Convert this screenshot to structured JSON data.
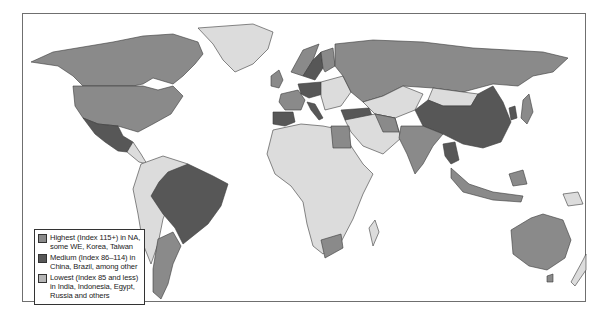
{
  "map": {
    "type": "choropleth",
    "projection": "world",
    "shade_colors": {
      "dark": "#575757",
      "mid": "#8a8a8a",
      "light": "#dcdcdc",
      "ocean": "#ffffff",
      "border": "#3a3a3a"
    },
    "legend": {
      "items": [
        {
          "label": "Highest (Index 115+) in NA, some WE, Korea, Taiwan",
          "swatch": "#8a8a8a"
        },
        {
          "label": "Medium (Index 86–114) in China, Brazil, among other",
          "swatch": "#575757"
        },
        {
          "label": "Lowest (Index 85 and less) in India, Indonesia, Egypt, Russia and others",
          "swatch": "#b5b5b5"
        }
      ]
    },
    "note": "Legend key-to-shade pairing as printed does not match shading of several regions (e.g. Russia and India listed under Lowest but drawn mid-gray). Shades below record what is visibly drawn.",
    "regions_by_visible_shade": {
      "dark": [
        "Mexico",
        "China",
        "Brazil",
        "Germany",
        "Spain",
        "Italy",
        "Sweden",
        "Turkey",
        "Thailand",
        "Cambodia",
        "Korea"
      ],
      "mid": [
        "Canada",
        "United States",
        "Russia",
        "France",
        "United Kingdom",
        "Norway",
        "Finland",
        "India",
        "Egypt",
        "Argentina",
        "South Africa",
        "Australia",
        "Indonesia",
        "Malaysia",
        "Japan",
        "Kazakhstan",
        "Iran"
      ],
      "light": [
        "Greenland",
        "Mongolia",
        "Central America",
        "Colombia",
        "Venezuela",
        "Peru",
        "Bolivia",
        "Chile",
        "Paraguay",
        "Uruguay",
        "Africa (most)",
        "Middle East (most)",
        "Central Asia",
        "Papua New Guinea",
        "New Zealand",
        "Eastern Europe"
      ]
    }
  }
}
